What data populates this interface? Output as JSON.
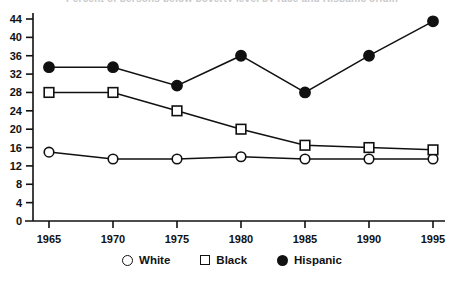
{
  "title_clipped": "Percent of persons below poverty level by race and Hispanic origin",
  "legend": {
    "position": "bottom-center",
    "items": [
      {
        "label": "White",
        "marker": "open-circle-icon"
      },
      {
        "label": "Black",
        "marker": "open-square-icon"
      },
      {
        "label": "Hispanic",
        "marker": "filled-circle-icon"
      }
    ]
  },
  "axis": {
    "y_ticks": [
      "0",
      "4",
      "8",
      "12",
      "16",
      "20",
      "24",
      "28",
      "32",
      "36",
      "40",
      "44"
    ],
    "x_ticks": [
      "1965",
      "1970",
      "1975",
      "1980",
      "1985",
      "1990",
      "1995"
    ]
  },
  "chart_data": {
    "type": "line",
    "title": "",
    "xlabel": "",
    "ylabel": "",
    "x": [
      1965,
      1970,
      1975,
      1980,
      1985,
      1990,
      1995
    ],
    "categories": [
      "1965",
      "1970",
      "1975",
      "1980",
      "1985",
      "1990",
      "1995"
    ],
    "series": [
      {
        "name": "White",
        "marker": "open-circle",
        "color": "#111111",
        "values": [
          15.0,
          13.5,
          13.5,
          14.0,
          13.5,
          13.5,
          13.5
        ]
      },
      {
        "name": "Black",
        "marker": "open-square",
        "color": "#111111",
        "values": [
          28.0,
          28.0,
          24.0,
          20.0,
          16.5,
          16.0,
          15.5
        ]
      },
      {
        "name": "Hispanic",
        "marker": "filled-circle",
        "color": "#111111",
        "values": [
          33.5,
          33.5,
          29.5,
          36.0,
          28.0,
          36.0,
          43.5
        ]
      }
    ],
    "ylim": [
      0,
      46
    ],
    "xlim": [
      1963,
      1997
    ],
    "ytick_step": 4,
    "grid": false,
    "legend_position": "bottom-center"
  }
}
